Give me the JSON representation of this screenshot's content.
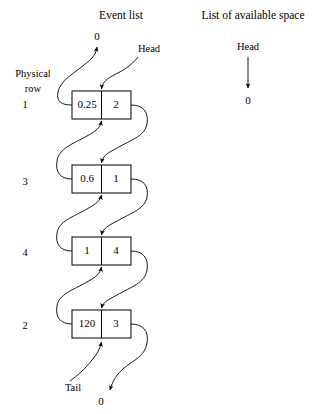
{
  "diagram": {
    "title_left": "Event list",
    "title_right": "List of available space",
    "physical_row_label_line1": "Physical",
    "physical_row_label_line2": "row",
    "head_label": "Head",
    "tail_label": "Tail",
    "null_top": "0",
    "null_bottom": "0",
    "avail_head_label": "Head",
    "avail_null": "0",
    "nodes": [
      {
        "row": "1",
        "time": "0.25",
        "next": "2"
      },
      {
        "row": "3",
        "time": "0.6",
        "next": "1"
      },
      {
        "row": "4",
        "time": "1",
        "next": "4"
      },
      {
        "row": "2",
        "time": "120",
        "next": "3"
      }
    ]
  }
}
